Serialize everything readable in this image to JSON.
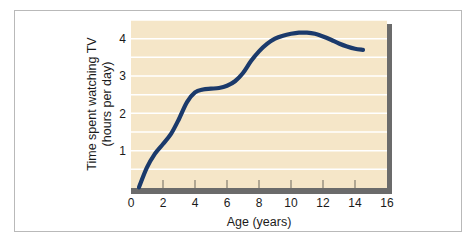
{
  "figure": {
    "background_color": "#ffffff",
    "frame_color": "#b9b9b9"
  },
  "chart_data": {
    "type": "line",
    "title": "",
    "xlabel": "Age (years)",
    "ylabel": "Time spent watching TV\n(hours per day)",
    "ylabel_line1": "Time spent watching TV",
    "ylabel_line2": "(hours per day)",
    "xlim": [
      0,
      16
    ],
    "ylim": [
      0,
      4.5
    ],
    "xticks": [
      0,
      2,
      4,
      6,
      8,
      10,
      12,
      14,
      16
    ],
    "xtick_labels": [
      "0",
      "2",
      "4",
      "6",
      "8",
      "10",
      "12",
      "14",
      "16"
    ],
    "yticks": [
      1,
      2,
      3,
      4
    ],
    "ytick_labels": [
      "1",
      "2",
      "3",
      "4"
    ],
    "grid": "horizontal",
    "grid_step": 0.5,
    "grid_color": "#ffffff",
    "plot_background": "#f5e6c8",
    "shadow_color": "#6b6b6b",
    "line_color": "#1b3a6b",
    "line_width": 4.2,
    "legend": "none",
    "x": [
      0.5,
      1.0,
      1.5,
      2.0,
      2.5,
      3.0,
      3.5,
      4.0,
      4.5,
      5.0,
      5.5,
      6.0,
      6.5,
      7.0,
      7.5,
      8.0,
      8.5,
      9.0,
      9.5,
      10.0,
      10.5,
      11.0,
      11.5,
      12.0,
      12.5,
      13.0,
      13.5,
      14.0,
      14.5
    ],
    "values": [
      0.02,
      0.55,
      0.92,
      1.18,
      1.45,
      1.85,
      2.3,
      2.56,
      2.64,
      2.66,
      2.68,
      2.74,
      2.86,
      3.08,
      3.4,
      3.66,
      3.86,
      4.0,
      4.08,
      4.13,
      4.16,
      4.16,
      4.13,
      4.06,
      3.97,
      3.87,
      3.79,
      3.73,
      3.7
    ],
    "series": [
      {
        "name": "Time spent watching TV",
        "values": [
          0.02,
          0.55,
          0.92,
          1.18,
          1.45,
          1.85,
          2.3,
          2.56,
          2.64,
          2.66,
          2.68,
          2.74,
          2.86,
          3.08,
          3.4,
          3.66,
          3.86,
          4.0,
          4.08,
          4.13,
          4.16,
          4.16,
          4.13,
          4.06,
          3.97,
          3.87,
          3.79,
          3.73,
          3.7
        ]
      }
    ],
    "annotations": []
  }
}
